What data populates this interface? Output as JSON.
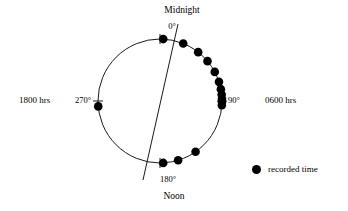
{
  "figure": {
    "type": "circular-time-diagram",
    "background_color": "#ffffff",
    "ink_color": "#000000"
  },
  "labels": {
    "top_cardinal": "Midnight",
    "bottom_cardinal": "Noon",
    "angle_0": "0°",
    "angle_90": "90°",
    "angle_180": "180°",
    "angle_270": "270°",
    "left_hours": "1800 hrs",
    "right_hours": "0600 hrs"
  },
  "legend": {
    "marker_label": "recorded time",
    "marker_color": "#000000",
    "marker_shape": "filled-circle"
  },
  "chart_data": {
    "type": "scatter",
    "title": "",
    "coordinate_system": "polar-clock",
    "angle_origin": "top",
    "angle_direction": "clockwise",
    "axis_range_degrees": [
      0,
      360
    ],
    "grid": false,
    "legend_position": "bottom-right",
    "axis_tick_labels": [
      "0°",
      "90°",
      "180°",
      "270°"
    ],
    "axis_annotations": [
      {
        "label": "Midnight",
        "degrees": 0
      },
      {
        "label": "0600 hrs",
        "degrees": 90
      },
      {
        "label": "Noon",
        "degrees": 180
      },
      {
        "label": "1800 hrs",
        "degrees": 270
      }
    ],
    "circle": {
      "cx": 160,
      "cy": 101,
      "r": 62
    },
    "mean_axis_line": {
      "x1": 178,
      "y1": 24,
      "x2": 143,
      "y2": 180
    },
    "series": [
      {
        "name": "recorded time",
        "marker": "filled-circle",
        "color": "#000000",
        "angles_degrees": [
          3,
          22,
          38,
          50,
          62,
          72,
          79,
          84,
          88,
          91,
          94,
          145,
          163,
          177,
          265
        ]
      }
    ]
  }
}
